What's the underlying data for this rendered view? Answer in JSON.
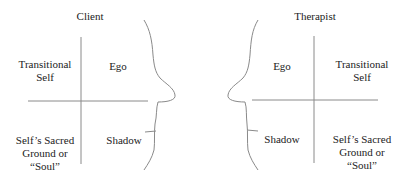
{
  "client": {
    "title": "Client",
    "quadrants": {
      "top_left": "Transitional\nSelf",
      "top_right": "Ego",
      "bottom_left": "Self’s Sacred\nGround or\n“Soul”",
      "bottom_right": "Shadow"
    }
  },
  "therapist": {
    "title": "Therapist",
    "quadrants": {
      "top_left": "Ego",
      "top_right": "Transitional\nSelf",
      "bottom_left": "Shadow",
      "bottom_right": "Self’s Sacred\nGround or\n“Soul”"
    }
  },
  "colors": {
    "line": "#888888",
    "text": "#222222"
  }
}
